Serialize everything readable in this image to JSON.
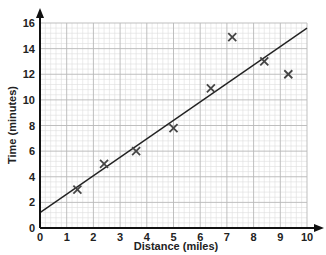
{
  "chart_data": {
    "type": "scatter",
    "title": "",
    "xlabel": "Distance (miles)",
    "ylabel": "Time (minutes)",
    "xlim": [
      0,
      10
    ],
    "ylim": [
      0,
      16
    ],
    "x_ticks": [
      0,
      1,
      2,
      3,
      4,
      5,
      6,
      7,
      8,
      9,
      10
    ],
    "y_ticks": [
      0,
      2,
      4,
      6,
      8,
      10,
      12,
      14,
      16
    ],
    "grid": true,
    "grid_minor_divisions": 5,
    "marker": "x",
    "legend": null,
    "series": [
      {
        "name": "observations",
        "points": [
          {
            "x": 1.4,
            "y": 3
          },
          {
            "x": 2.4,
            "y": 5
          },
          {
            "x": 3.6,
            "y": 6
          },
          {
            "x": 5.0,
            "y": 7.8
          },
          {
            "x": 6.4,
            "y": 10.9
          },
          {
            "x": 7.2,
            "y": 14.9
          },
          {
            "x": 8.4,
            "y": 13
          },
          {
            "x": 9.3,
            "y": 12
          }
        ]
      }
    ],
    "trend_line": {
      "type": "line of best fit",
      "start": {
        "x": 0,
        "y": 1.2
      },
      "end": {
        "x": 10,
        "y": 15.6
      }
    }
  },
  "colors": {
    "axis": "#111111",
    "grid_major": "#b8b8b8",
    "grid_minor": "#dddddd",
    "marker": "#444444",
    "trend_line": "#222222"
  }
}
